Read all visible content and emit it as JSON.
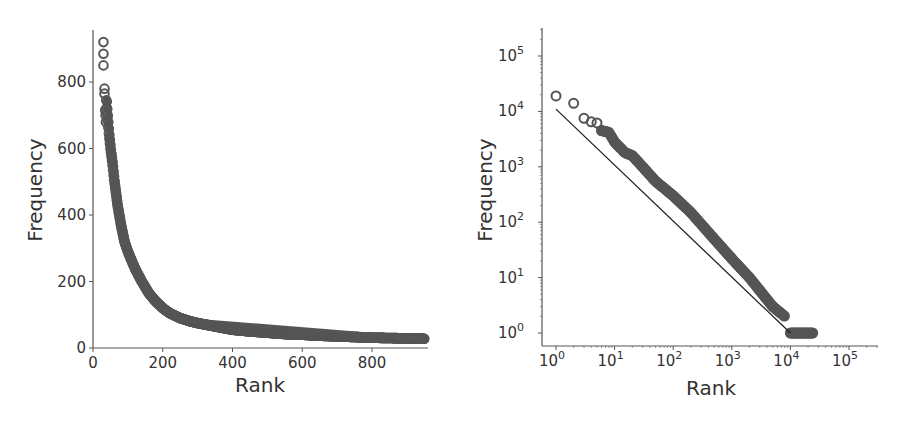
{
  "chart_data": [
    {
      "type": "scatter",
      "title": "",
      "xlabel": "Rank",
      "ylabel": "Frequency",
      "xscale": "linear",
      "yscale": "linear",
      "xlim": [
        0,
        950
      ],
      "ylim": [
        0,
        950
      ],
      "xticks": [
        0,
        200,
        400,
        600,
        800
      ],
      "xtick_labels": [
        "0",
        "200",
        "400",
        "600",
        "800"
      ],
      "yticks": [
        0,
        200,
        400,
        600,
        800
      ],
      "ytick_labels": [
        "0",
        "200",
        "400",
        "600",
        "800"
      ],
      "grid": false,
      "legend": null,
      "marker": "open circle",
      "marker_color": "#555555",
      "series": [
        {
          "name": "word frequency",
          "x": [
            30,
            31,
            32,
            36,
            37,
            40,
            42,
            45,
            50,
            55,
            60,
            65,
            70,
            80,
            90,
            100,
            120,
            140,
            160,
            180,
            200,
            220,
            250,
            280,
            300,
            350,
            400,
            450,
            500,
            550,
            600,
            650,
            700,
            750,
            800,
            850,
            900,
            950
          ],
          "y": [
            920,
            885,
            850,
            780,
            760,
            715,
            690,
            650,
            600,
            560,
            510,
            470,
            430,
            370,
            320,
            290,
            240,
            200,
            165,
            140,
            120,
            105,
            90,
            80,
            75,
            65,
            55,
            50,
            46,
            42,
            40,
            37,
            35,
            33,
            31,
            30,
            29,
            28
          ]
        }
      ]
    },
    {
      "type": "scatter",
      "title": "",
      "xlabel": "Rank",
      "ylabel": "Frequency",
      "xscale": "log",
      "yscale": "log",
      "xlim": [
        0.5,
        300000
      ],
      "ylim": [
        0.5,
        300000
      ],
      "xticks": [
        1,
        10,
        100,
        1000,
        10000,
        100000
      ],
      "xtick_labels": [
        "10^0",
        "10^1",
        "10^2",
        "10^3",
        "10^4",
        "10^5"
      ],
      "yticks": [
        1,
        10,
        100,
        1000,
        10000,
        100000
      ],
      "ytick_labels": [
        "10^0",
        "10^1",
        "10^2",
        "10^3",
        "10^4",
        "10^5"
      ],
      "grid": false,
      "legend": null,
      "marker": "open circle",
      "marker_color": "#555555",
      "series": [
        {
          "name": "word frequency",
          "x": [
            1,
            2,
            3,
            4,
            5,
            6,
            8,
            10,
            15,
            20,
            30,
            50,
            100,
            200,
            500,
            1000,
            2000,
            5000,
            8000,
            10000,
            15000,
            20000,
            25000
          ],
          "y": [
            19000,
            14000,
            7500,
            6500,
            6200,
            4500,
            4200,
            2800,
            1800,
            1600,
            1000,
            550,
            300,
            150,
            50,
            22,
            10,
            3,
            2,
            1,
            1,
            1,
            1
          ]
        },
        {
          "name": "reference line",
          "type": "line",
          "color": "#222222",
          "x": [
            1,
            10000
          ],
          "y": [
            11000,
            1
          ]
        }
      ]
    }
  ],
  "panels": {
    "left": {
      "xlabel": "Rank",
      "ylabel": "Frequency",
      "xtick_labels": [
        "0",
        "200",
        "400",
        "600",
        "800"
      ],
      "ytick_labels": [
        "0",
        "200",
        "400",
        "600",
        "800"
      ]
    },
    "right": {
      "xlabel": "Rank",
      "ylabel": "Frequency",
      "xtick_exponents": [
        "0",
        "1",
        "2",
        "3",
        "4",
        "5"
      ],
      "ytick_exponents": [
        "0",
        "1",
        "2",
        "3",
        "4",
        "5"
      ],
      "tick_base": "10"
    }
  }
}
